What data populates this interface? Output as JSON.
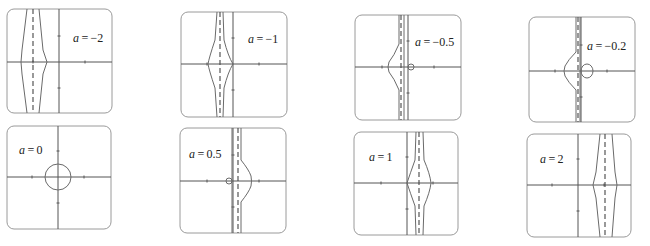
{
  "figure": {
    "colors": {
      "frame": "#9a9a9a",
      "axis": "#555555",
      "curve": "#6a6a6a",
      "asymptote": "#444444",
      "text": "#222222"
    }
  },
  "panels": [
    {
      "label_var": "a",
      "label_eq": " = ",
      "label_val": "−2",
      "a": -2,
      "box": [
        7,
        9,
        105,
        104
      ],
      "origin": [
        59,
        62
      ],
      "label_pos": [
        73,
        42
      ],
      "asymptote_x": 33,
      "curves": [
        "M27,9 L22,50 L21,62 L22,74 L27,113",
        "M39,9 L43,50 L47,62 L43,74 L39,113"
      ],
      "circle": null
    },
    {
      "label_var": "a",
      "label_eq": " = ",
      "label_val": "−1",
      "a": -1,
      "box": [
        181,
        12,
        106,
        105
      ],
      "origin": [
        233,
        64
      ],
      "label_pos": [
        248,
        43
      ],
      "asymptote_x": 220,
      "curves": [
        "M217,12 L215,40 Q209,58 208,64 Q209,70 215,88 L217,117",
        "M223,12 L224,40 Q228,56 233,64 Q228,72 224,88 L223,117"
      ],
      "circle": null
    },
    {
      "label_var": "a",
      "label_eq": " = ",
      "label_val": "−0.5",
      "a": -0.5,
      "box": [
        355,
        15,
        106,
        105
      ],
      "origin": [
        408,
        67
      ],
      "label_pos": [
        415,
        46
      ],
      "asymptote_x": 401,
      "curves": [
        "M399,15 L399,44 Q394,56 389,62 Q387,67 389,72 Q394,78 399,90 L399,120",
        "M404,15 L404,120"
      ],
      "circle": {
        "cx": 411,
        "cy": 67,
        "rx": 3,
        "ry": 3
      }
    },
    {
      "label_var": "a",
      "label_eq": " = ",
      "label_val": "−0.2",
      "a": -0.2,
      "box": [
        529,
        17,
        106,
        105
      ],
      "origin": [
        581,
        71
      ],
      "label_pos": [
        587,
        50
      ],
      "asymptote_x": 578,
      "curves": [
        "M576,17 L576,52 Q568,60 565,66 Q563,71 565,76 Q568,82 576,90 L576,122",
        "M580,17 L580,122"
      ],
      "circle": {
        "cx": 587,
        "cy": 71,
        "rx": 6,
        "ry": 7
      }
    },
    {
      "label_var": "a",
      "label_eq": " = ",
      "label_val": "0",
      "a": 0,
      "box": [
        7,
        126,
        104,
        103
      ],
      "origin": [
        58,
        177
      ],
      "label_pos": [
        19,
        154
      ],
      "asymptote_x": null,
      "curves": [],
      "circle": {
        "cx": 58,
        "cy": 177,
        "rx": 13,
        "ry": 13
      }
    },
    {
      "label_var": "a",
      "label_eq": " = ",
      "label_val": "0.5",
      "a": 0.5,
      "box": [
        180,
        128,
        106,
        105
      ],
      "origin": [
        233,
        181
      ],
      "label_pos": [
        189,
        158
      ],
      "asymptote_x": 238,
      "curves": [
        "M232,128 L232,233",
        "M241,128 L241,160 Q249,170 251,176 Q252,181 251,186 Q249,192 241,202 L241,233"
      ],
      "circle": {
        "cx": 229,
        "cy": 181,
        "rx": 3,
        "ry": 3
      }
    },
    {
      "label_var": "a",
      "label_eq": " = ",
      "label_val": "1",
      "a": 1,
      "box": [
        354,
        132,
        104,
        103
      ],
      "origin": [
        407,
        183
      ],
      "label_pos": [
        369,
        161
      ],
      "asymptote_x": 419,
      "curves": [
        "M416,132 L415,160 Q410,174 407,183 Q410,192 415,206 L416,235",
        "M423,132 L424,160 Q430,174 431,183 Q430,192 424,206 L423,235"
      ],
      "circle": null
    },
    {
      "label_var": "a",
      "label_eq": " = ",
      "label_val": "2",
      "a": 2,
      "box": [
        527,
        134,
        104,
        103
      ],
      "origin": [
        578,
        185
      ],
      "label_pos": [
        540,
        163
      ],
      "asymptote_x": 605,
      "curves": [
        "M600,134 L596,172 L593,185 L596,198 L600,237",
        "M612,134 L615,172 L617,185 L615,198 L612,237"
      ],
      "circle": null
    }
  ]
}
